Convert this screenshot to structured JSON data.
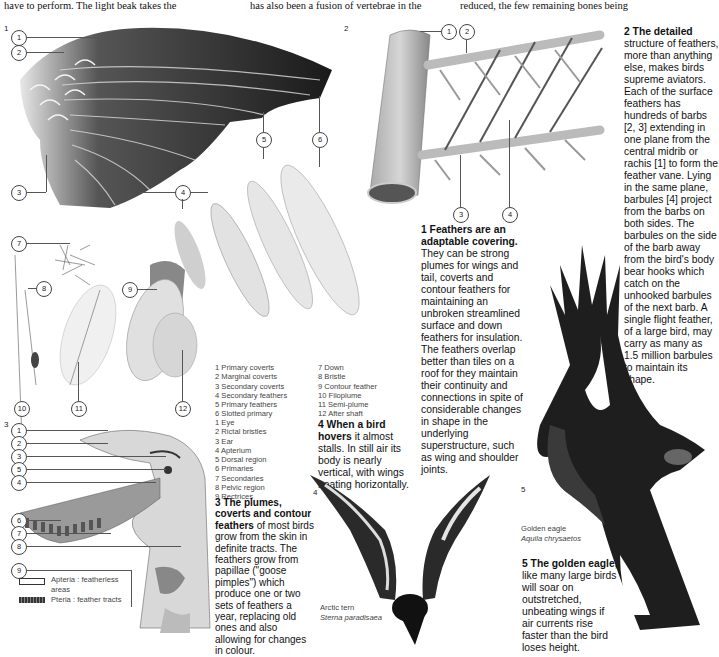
{
  "running_text": {
    "col1": "have to perform. The light beak takes the",
    "col2": "has also been a fusion of vertebrae in the",
    "col3": "reduced, the few remaining bones being"
  },
  "figures": {
    "fig1": {
      "number": "1",
      "callouts": [
        "1",
        "2",
        "3",
        "4",
        "5",
        "6",
        "7",
        "8",
        "9",
        "10",
        "11",
        "12"
      ],
      "caption_title": "1 Feathers are an adaptable covering.",
      "caption_body": "They can be strong plumes for wings and tail, coverts and contour feathers for maintaining an unbroken streamlined surface and down feathers for insulation. The feathers overlap better than tiles on a roof for they maintain their continuity and connections in spite of considerable changes in shape in the underlying superstructure, such as wing and shoulder joints.",
      "legend_left": [
        "1 Primary coverts",
        "2 Marginal coverts",
        "3 Secondary coverts",
        "4 Secondary feathers",
        "5 Primary feathers",
        "6 Slotted primary"
      ],
      "legend_right": [
        "7 Down",
        "8 Bristle",
        "9 Contour feather",
        "10 Filoplume",
        "11 Semi-plume",
        "12 After shaft"
      ]
    },
    "fig2": {
      "number": "2",
      "callouts": [
        "1",
        "2",
        "3",
        "4"
      ],
      "caption_title": "2 The detailed",
      "caption_body": "structure of feathers, more than anything else, makes birds supreme aviators. Each of the surface feathers has hundreds of barbs [2, 3] extending in one plane from the central midrib or rachis [1] to form the feather vane. Lying in the same plane, barbules [4] project from the barbs on both sides. The barbules on the side of the barb away from the bird's body bear hooks which catch on the unhooked barbules of the next barb. A single flight feather, of a large bird, may carry as many as 1.5 million barbules to maintain its shape."
    },
    "fig3": {
      "number": "3",
      "callouts": [
        "1",
        "2",
        "3",
        "5",
        "4",
        "6",
        "7",
        "8",
        "9"
      ],
      "legend": [
        "1 Eye",
        "2 Rictal bristles",
        "3 Ear",
        "4 Apterium",
        "5 Dorsal region",
        "6 Primaries",
        "7 Secondaries",
        "8 Pelvic region",
        "9 Rectrices"
      ],
      "key": [
        {
          "swatch": "featherless",
          "label": "Apteria : featherless areas"
        },
        {
          "swatch": "tracts",
          "label": "Pteria : feather tracts"
        }
      ],
      "caption_title": "3 The plumes, coverts and contour feathers",
      "caption_body": "of most birds grow from the skin in definite tracts. The feathers grow from papillae (\"goose pimples\") which produce one or two sets of feathers a year, replacing old ones and also allowing for changes in colour."
    },
    "fig4": {
      "number": "4",
      "caption_title": "4 When a bird hovers",
      "caption_body": "it almost stalls. In still air its body is nearly vertical, with wings beating horizontally.",
      "species_common": "Arctic tern",
      "species_latin": "Sterna paradisaea"
    },
    "fig5": {
      "number": "5",
      "caption_title": "5 The golden eagle,",
      "caption_body": "like many large birds will soar on outstretched, unbeating wings if air currents rise faster than the bird loses height.",
      "species_common": "Golden eagle",
      "species_latin": "Aquila chrysaetos"
    }
  },
  "colors": {
    "ink": "#111111",
    "illustration_dark": "#1e1e1e",
    "illustration_mid": "#7a7a7a",
    "paper": "#ffffff"
  }
}
